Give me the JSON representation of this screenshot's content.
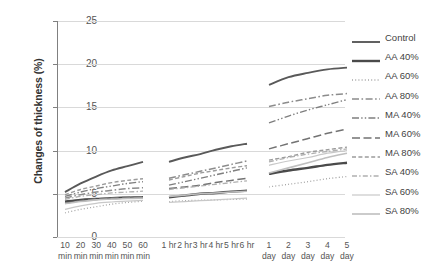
{
  "chart_data": {
    "type": "line",
    "title": "",
    "xlabel": "",
    "ylabel": "Changes of thickness (%)",
    "ylim": [
      0,
      25
    ],
    "yticks": [
      0,
      5,
      10,
      15,
      20,
      25
    ],
    "grid": true,
    "legend_position": "right",
    "categories": [
      "10 min",
      "20 min",
      "30 min",
      "40 min",
      "50 min",
      "60 min",
      "1 hr",
      "2 hr",
      "3 hr",
      "4 hr",
      "5 hr",
      "6 hr",
      "1 day",
      "2 day",
      "3 day",
      "4 day",
      "5 day"
    ],
    "category_lines": [
      [
        "10",
        "min"
      ],
      [
        "20",
        "min"
      ],
      [
        "30",
        "min"
      ],
      [
        "40",
        "min"
      ],
      [
        "50",
        "min"
      ],
      [
        "60",
        "min"
      ],
      [
        "1 hr",
        ""
      ],
      [
        "2 hr",
        ""
      ],
      [
        "3 hr",
        ""
      ],
      [
        "4 hr",
        ""
      ],
      [
        "5 hr",
        ""
      ],
      [
        "6 hr",
        ""
      ],
      [
        "1",
        "day"
      ],
      [
        "2",
        "day"
      ],
      [
        "3",
        "day"
      ],
      [
        "4",
        "day"
      ],
      [
        "5",
        "day"
      ]
    ],
    "segments": [
      {
        "name": "minutes",
        "indices": [
          0,
          1,
          2,
          3,
          4,
          5
        ]
      },
      {
        "name": "hours",
        "indices": [
          6,
          7,
          8,
          9,
          10,
          11
        ]
      },
      {
        "name": "days",
        "indices": [
          12,
          13,
          14,
          15,
          16
        ]
      }
    ],
    "series": [
      {
        "name": "Control",
        "style": "solid",
        "color": "#595959",
        "width": 1.9,
        "values": [
          5.2,
          6.2,
          7.0,
          7.7,
          8.2,
          8.7,
          8.7,
          9.2,
          9.6,
          10.1,
          10.5,
          10.8,
          17.6,
          18.5,
          19.0,
          19.4,
          19.6
        ]
      },
      {
        "name": "AA 40%",
        "style": "solid",
        "color": "#4a4a4a",
        "width": 2.4,
        "values": [
          4.1,
          4.3,
          4.4,
          4.5,
          4.55,
          4.6,
          4.6,
          4.8,
          5.0,
          5.1,
          5.25,
          5.35,
          7.3,
          7.7,
          8.0,
          8.35,
          8.6
        ]
      },
      {
        "name": "AA 60%",
        "style": "dotted",
        "color": "#a6a6a6",
        "width": 1.3,
        "values": [
          2.8,
          3.2,
          3.5,
          3.8,
          4.0,
          4.15,
          4.1,
          4.2,
          4.25,
          4.3,
          4.35,
          4.4,
          5.8,
          6.1,
          6.4,
          6.75,
          7.0
        ]
      },
      {
        "name": "AA 80%",
        "style": "dashdot",
        "color": "#8c8c8c",
        "width": 1.5,
        "values": [
          4.5,
          4.9,
          5.2,
          5.4,
          5.6,
          5.7,
          6.8,
          7.2,
          7.6,
          8.0,
          8.4,
          8.8,
          15.1,
          15.6,
          16.0,
          16.4,
          16.6
        ]
      },
      {
        "name": "MA 40%",
        "style": "dashdotdot",
        "color": "#7f7f7f",
        "width": 1.4,
        "values": [
          4.7,
          5.2,
          5.6,
          5.9,
          6.2,
          6.4,
          6.0,
          6.4,
          6.8,
          7.2,
          7.6,
          8.0,
          13.2,
          14.0,
          14.7,
          15.3,
          15.9
        ]
      },
      {
        "name": "MA 60%",
        "style": "longdash",
        "color": "#737373",
        "width": 1.5,
        "values": [
          3.9,
          4.2,
          4.4,
          4.5,
          4.6,
          4.65,
          5.6,
          5.8,
          6.0,
          6.3,
          6.55,
          6.8,
          10.2,
          10.8,
          11.4,
          12.0,
          12.5
        ]
      },
      {
        "name": "MA 80%",
        "style": "dashed",
        "color": "#9c9c9c",
        "width": 1.4,
        "values": [
          4.9,
          5.5,
          5.9,
          6.3,
          6.55,
          6.75,
          6.6,
          7.0,
          7.4,
          7.7,
          8.0,
          8.25,
          8.9,
          9.3,
          9.8,
          10.1,
          10.4
        ]
      },
      {
        "name": "SA 40%",
        "style": "dashdot-light",
        "color": "#b0b0b0",
        "width": 1.3,
        "values": [
          4.35,
          4.7,
          4.9,
          5.1,
          5.2,
          5.3,
          5.5,
          5.7,
          5.9,
          6.1,
          6.3,
          6.5,
          8.7,
          9.2,
          9.6,
          9.9,
          10.2
        ]
      },
      {
        "name": "SA 60%",
        "style": "solid",
        "color": "#c8c8c8",
        "width": 1.2,
        "values": [
          3.2,
          3.6,
          3.9,
          4.05,
          4.15,
          4.25,
          4.0,
          4.1,
          4.2,
          4.3,
          4.4,
          4.5,
          8.3,
          8.8,
          9.2,
          9.7,
          10.0
        ]
      },
      {
        "name": "SA 80%",
        "style": "solid",
        "color": "#bfbfbf",
        "width": 1.6,
        "values": [
          3.85,
          4.1,
          4.3,
          4.4,
          4.45,
          4.5,
          4.7,
          4.85,
          5.0,
          5.1,
          5.2,
          5.3,
          7.4,
          8.0,
          8.6,
          9.2,
          9.7
        ]
      }
    ]
  },
  "legend": {
    "items": [
      {
        "label": "Control"
      },
      {
        "label": "AA 40%"
      },
      {
        "label": "AA 60%"
      },
      {
        "label": "AA 80%"
      },
      {
        "label": "MA 40%"
      },
      {
        "label": "MA 60%"
      },
      {
        "label": "MA 80%"
      },
      {
        "label": "SA 40%"
      },
      {
        "label": "SA 60%"
      },
      {
        "label": "SA 80%"
      }
    ]
  }
}
